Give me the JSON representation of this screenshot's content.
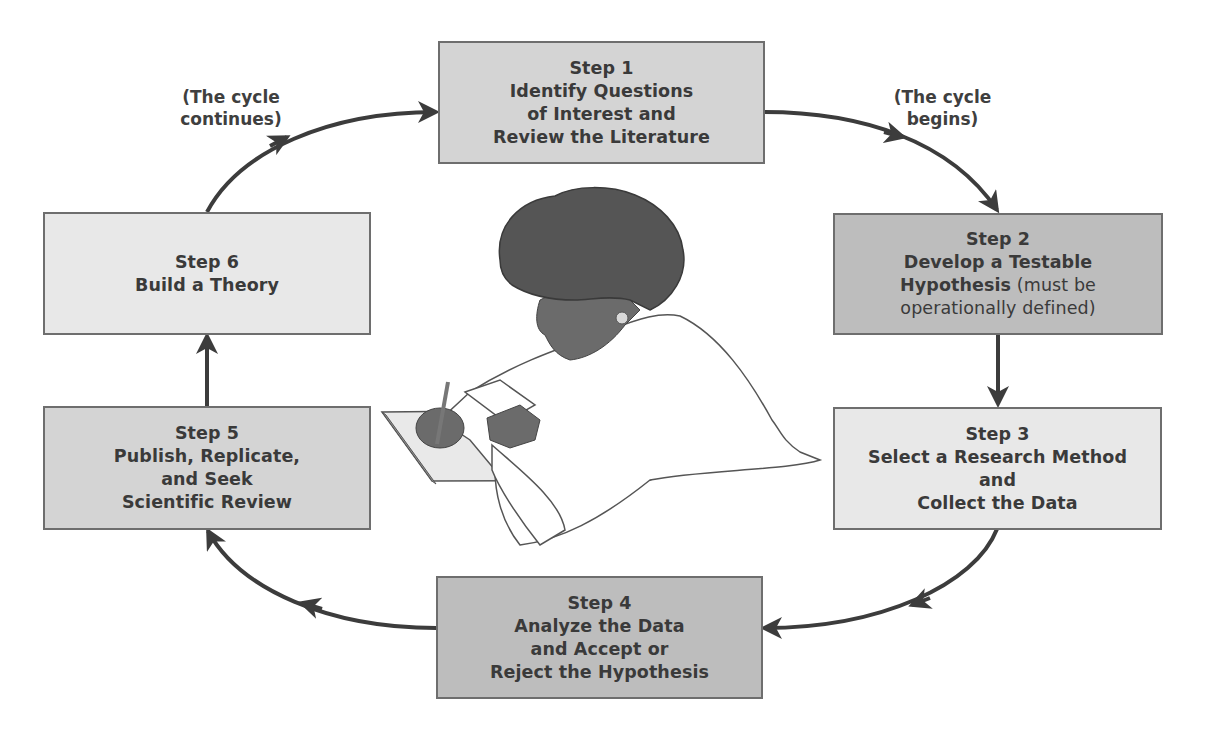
{
  "diagram": {
    "type": "cycle-flowchart",
    "colors": {
      "box_dark": "#bcbcbc",
      "box_medium": "#d2d2d2",
      "box_light": "#e7e7e7",
      "arrow": "#3c3c3c",
      "text": "#3a3a3a"
    },
    "steps": [
      {
        "id": "step1",
        "title": "Step 1",
        "lines": [
          "Identify Questions",
          "of Interest and",
          "Review the Literature"
        ]
      },
      {
        "id": "step2",
        "title": "Step 2",
        "lines": [
          "Develop a Testable"
        ],
        "mixed_line": {
          "bold": "Hypothesis",
          "normal": " (must be"
        },
        "extra_normal": "operationally defined)"
      },
      {
        "id": "step3",
        "title": "Step 3",
        "lines": [
          "Select a Research Method",
          "and",
          "Collect the Data"
        ]
      },
      {
        "id": "step4",
        "title": "Step 4",
        "lines": [
          "Analyze the Data",
          "and Accept or",
          "Reject the Hypothesis"
        ]
      },
      {
        "id": "step5",
        "title": "Step 5",
        "lines": [
          "Publish, Replicate,",
          "and Seek",
          "Scientific Review"
        ]
      },
      {
        "id": "step6",
        "title": "Step 6",
        "lines": [
          "Build a Theory"
        ]
      }
    ],
    "annotations": {
      "cycle_begins": [
        "(The cycle",
        "begins)"
      ],
      "cycle_continues": [
        "(The cycle",
        "continues)"
      ]
    },
    "illustration": "person-writing-on-notepad",
    "edges": [
      [
        "step1",
        "step2"
      ],
      [
        "step2",
        "step3"
      ],
      [
        "step3",
        "step4"
      ],
      [
        "step4",
        "step5"
      ],
      [
        "step5",
        "step6"
      ],
      [
        "step6",
        "step1"
      ]
    ]
  }
}
